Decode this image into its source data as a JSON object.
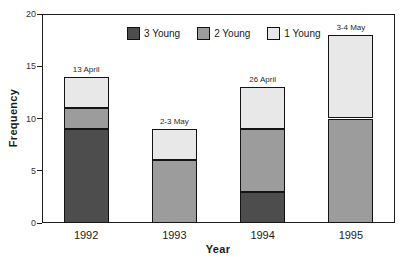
{
  "figure": {
    "background": "#ffffff",
    "frame_color": "#1c1c1c"
  },
  "chart_data": {
    "type": "bar",
    "stacked": true,
    "title": "",
    "xlabel": "Year",
    "ylabel": "Frequency",
    "ylim": [
      0,
      20
    ],
    "yticks": [
      0,
      5,
      10,
      15,
      20
    ],
    "categories": [
      "1992",
      "1993",
      "1994",
      "1995"
    ],
    "series": [
      {
        "name": "3 Young",
        "color": "#4d4d4d",
        "values": [
          9,
          0,
          3,
          0
        ]
      },
      {
        "name": "2 Young",
        "color": "#9c9c9c",
        "values": [
          2,
          6,
          6,
          10
        ]
      },
      {
        "name": "1 Young",
        "color": "#e8e8e8",
        "values": [
          3,
          3,
          4,
          8
        ]
      }
    ],
    "totals": [
      14,
      9,
      13,
      18
    ],
    "bar_annotations": [
      "13 April",
      "2-3 May",
      "26 April",
      "3-4 May"
    ],
    "legend_position": "top-center-inside",
    "grid": false,
    "bar_border_color": "#141414"
  }
}
